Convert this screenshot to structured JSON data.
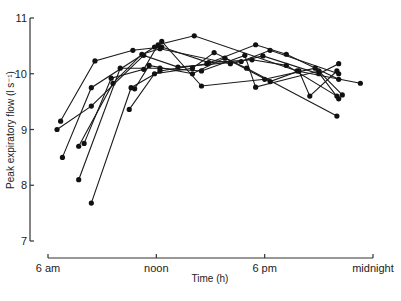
{
  "chart_data": {
    "type": "line",
    "title": "",
    "xlabel": "Time (h)",
    "ylabel": "Peak expiratory flow (l s⁻¹)",
    "xlim": [
      6,
      24
    ],
    "ylim": [
      7,
      11
    ],
    "x_ticks": [
      {
        "value": 6,
        "label": "6 am"
      },
      {
        "value": 12,
        "label": "noon"
      },
      {
        "value": 18,
        "label": "6 pm"
      },
      {
        "value": 24,
        "label": "midnight"
      }
    ],
    "y_ticks": [
      7,
      8,
      9,
      10,
      11
    ],
    "grid": false,
    "legend": null,
    "series": [
      {
        "name": "subject 1",
        "points": [
          [
            6.7,
            9.15
          ],
          [
            8.6,
            10.23
          ],
          [
            10.7,
            10.42
          ],
          [
            12.3,
            10.48
          ],
          [
            14.9,
            10.2
          ],
          [
            17.3,
            10.25
          ],
          [
            19.2,
            10.15
          ],
          [
            22.0,
            9.6
          ]
        ]
      },
      {
        "name": "subject 2",
        "points": [
          [
            6.5,
            9.0
          ],
          [
            8.4,
            9.42
          ],
          [
            11.3,
            10.33
          ],
          [
            13.2,
            10.12
          ],
          [
            16.7,
            10.22
          ],
          [
            18.3,
            10.42
          ],
          [
            22.1,
            10.0
          ]
        ]
      },
      {
        "name": "subject 3",
        "points": [
          [
            6.8,
            8.5
          ],
          [
            8.4,
            9.75
          ],
          [
            11.9,
            10.48
          ],
          [
            12.3,
            10.58
          ],
          [
            14.5,
            9.78
          ],
          [
            18.0,
            9.9
          ],
          [
            20.8,
            10.1
          ],
          [
            22.1,
            9.55
          ]
        ]
      },
      {
        "name": "subject 4",
        "points": [
          [
            7.7,
            8.7
          ],
          [
            9.6,
            9.83
          ],
          [
            11.2,
            10.35
          ],
          [
            12.2,
            10.45
          ],
          [
            16.1,
            10.18
          ],
          [
            17.9,
            10.32
          ],
          [
            21.0,
            10.0
          ],
          [
            22.1,
            10.18
          ]
        ]
      },
      {
        "name": "subject 5",
        "points": [
          [
            8.0,
            8.75
          ],
          [
            9.5,
            9.92
          ],
          [
            11.3,
            10.08
          ],
          [
            12.1,
            10.52
          ],
          [
            14.1,
            10.68
          ],
          [
            19.8,
            10.05
          ],
          [
            23.3,
            9.83
          ]
        ]
      },
      {
        "name": "subject 6",
        "points": [
          [
            7.7,
            8.1
          ],
          [
            10.0,
            10.1
          ],
          [
            12.2,
            10.1
          ],
          [
            14.5,
            10.05
          ],
          [
            16.9,
            10.33
          ],
          [
            17.5,
            9.76
          ],
          [
            21.0,
            10.05
          ],
          [
            22.3,
            9.62
          ]
        ]
      },
      {
        "name": "subject 7",
        "points": [
          [
            8.4,
            7.68
          ],
          [
            10.6,
            9.75
          ],
          [
            12.2,
            10.05
          ],
          [
            14.8,
            10.18
          ],
          [
            17.5,
            10.52
          ],
          [
            19.2,
            10.35
          ],
          [
            22.1,
            9.9
          ]
        ]
      },
      {
        "name": "subject 8",
        "points": [
          [
            10.5,
            9.36
          ],
          [
            11.9,
            10.0
          ],
          [
            14.0,
            10.1
          ],
          [
            15.2,
            10.38
          ],
          [
            17.0,
            10.1
          ],
          [
            22.0,
            9.24
          ]
        ]
      },
      {
        "name": "subject 9",
        "points": [
          [
            10.8,
            9.73
          ],
          [
            11.6,
            10.15
          ],
          [
            14.0,
            10.0
          ],
          [
            15.8,
            10.28
          ],
          [
            18.3,
            9.86
          ],
          [
            19.9,
            10.05
          ],
          [
            20.5,
            9.6
          ],
          [
            22.0,
            10.05
          ]
        ]
      }
    ]
  }
}
